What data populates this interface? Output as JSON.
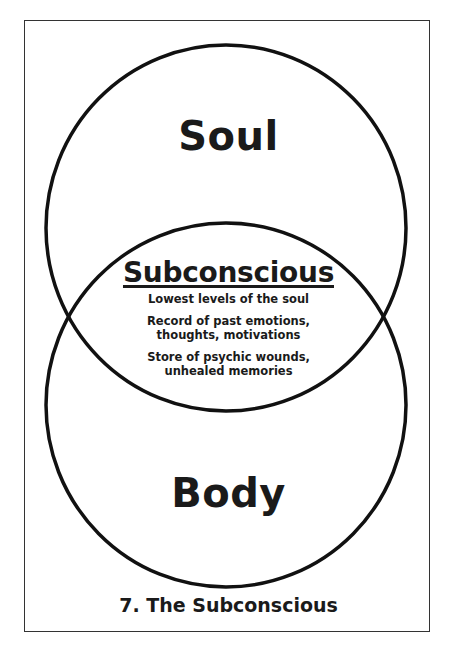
{
  "diagram": {
    "type": "venn",
    "circles": [
      {
        "id": "soul",
        "label": "Soul"
      },
      {
        "id": "body",
        "label": "Body"
      }
    ],
    "intersection": {
      "title": "Subconscious",
      "notes": [
        "Lowest levels of the soul",
        "Record of past emotions,\nthoughts, motivations",
        "Store of psychic wounds,\nunhealed memories"
      ]
    },
    "caption": "7. The Subconscious",
    "colors": {
      "stroke": "#111111",
      "text": "#1a1a1a",
      "frame": "#333333",
      "background": "#ffffff"
    }
  }
}
